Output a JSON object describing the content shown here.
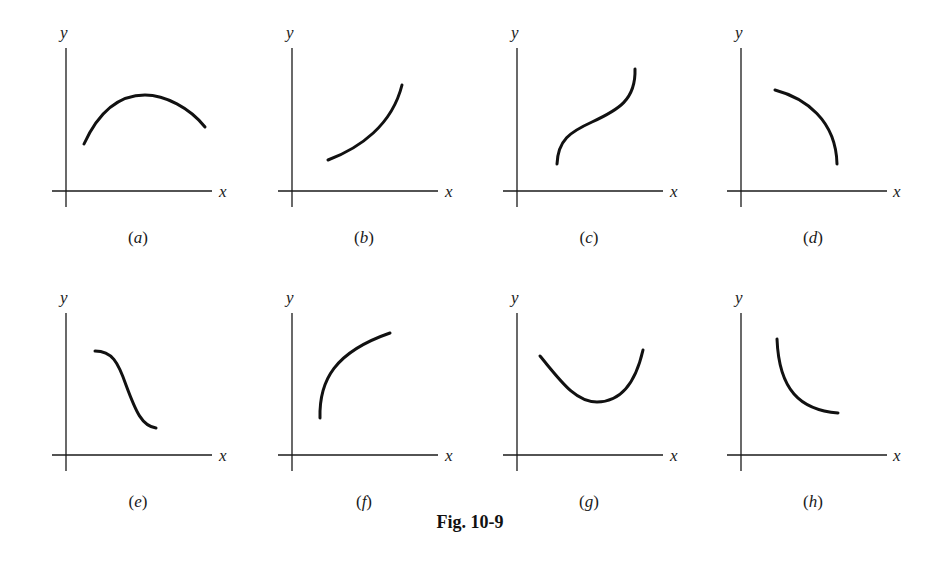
{
  "figure": {
    "caption": "Fig. 10-9",
    "x_axis_label": "x",
    "y_axis_label": "y"
  },
  "panels": [
    {
      "id": "a",
      "label_open": "(",
      "label_letter": "a",
      "label_close": ")",
      "shape": "concave-down arch (rises to maximum then falls)"
    },
    {
      "id": "b",
      "label_open": "(",
      "label_letter": "b",
      "label_close": ")",
      "shape": "increasing, concave up"
    },
    {
      "id": "c",
      "label_open": "(",
      "label_letter": "c",
      "label_close": ")",
      "shape": "increasing S-curve with inflection point"
    },
    {
      "id": "d",
      "label_open": "(",
      "label_letter": "d",
      "label_close": ")",
      "shape": "decreasing, concave down"
    },
    {
      "id": "e",
      "label_open": "(",
      "label_letter": "e",
      "label_close": ")",
      "shape": "decreasing reverse S-curve with inflection point"
    },
    {
      "id": "f",
      "label_open": "(",
      "label_letter": "f",
      "label_close": ")",
      "shape": "increasing, concave down"
    },
    {
      "id": "g",
      "label_open": "(",
      "label_letter": "g",
      "label_close": ")",
      "shape": "concave-up bowl (falls to minimum then rises)"
    },
    {
      "id": "h",
      "label_open": "(",
      "label_letter": "h",
      "label_close": ")",
      "shape": "decreasing, concave up"
    }
  ]
}
